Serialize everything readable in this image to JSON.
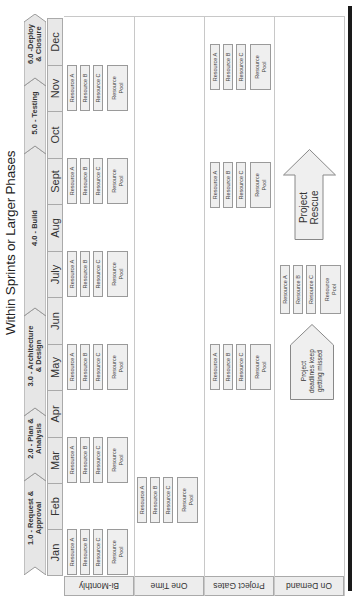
{
  "title": "Within Sprints or Larger Phases",
  "phases": [
    {
      "label": "1.0 - Request & Approval",
      "line1": "1.0 - Request &",
      "line2": "Approval"
    },
    {
      "label": "2.0 - Plan & Analysis",
      "line1": "2.0 - Plan &",
      "line2": "Analysis"
    },
    {
      "label": "3.0 - Architecture & Design",
      "line1": "3.0 - Architecture",
      "line2": "& Design"
    },
    {
      "label": "4.0 - Build",
      "line1": "4.0 - Build",
      "line2": ""
    },
    {
      "label": "5.0 - Testing",
      "line1": "5.0 - Testing",
      "line2": ""
    },
    {
      "label": "6.0 - Deploy & Closure",
      "line1": "6.0 -Deploy",
      "line2": "& Closure"
    }
  ],
  "months": [
    "Jan",
    "Feb",
    "Mar",
    "Apr",
    "May",
    "Jun",
    "July",
    "Aug",
    "Sept",
    "Oct",
    "Nov",
    "Dec"
  ],
  "rows": [
    {
      "label": "Bi-Monthly"
    },
    {
      "label": "One Time"
    },
    {
      "label": "Project Gates"
    },
    {
      "label": "On Demand"
    }
  ],
  "resource_group": {
    "a": "Resource A",
    "b": "Resource B",
    "c": "Resource C",
    "pool_line1": "Resource",
    "pool_line2": "Pool"
  },
  "groups": {
    "bi_monthly": [
      "Jan",
      "Mar",
      "May",
      "July",
      "Sept",
      "Nov"
    ],
    "one_time": [
      "Feb"
    ],
    "project_gates": [
      "May",
      "Aug-Sept",
      "Nov-Dec"
    ],
    "on_demand": [
      "Jun"
    ]
  },
  "on_demand": {
    "trigger_line1": "Project",
    "trigger_line2": "deadlines keep",
    "trigger_line3": "getting missed",
    "rescue_label": "Project Rescue"
  }
}
